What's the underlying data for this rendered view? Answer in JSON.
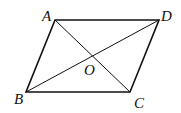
{
  "diagram": {
    "type": "parallelogram-with-diagonals",
    "stroke_color": "#111111",
    "background": "#ffffff",
    "vertices": {
      "A": {
        "x": 55,
        "y": 20,
        "label": "A",
        "label_x": 42,
        "label_y": 21
      },
      "D": {
        "x": 159,
        "y": 20,
        "label": "D",
        "label_x": 161,
        "label_y": 21
      },
      "B": {
        "x": 26,
        "y": 92,
        "label": "B",
        "label_x": 14,
        "label_y": 104
      },
      "C": {
        "x": 130,
        "y": 92,
        "label": "C",
        "label_x": 134,
        "label_y": 108
      }
    },
    "center": {
      "x": 92,
      "y": 56,
      "label": "O",
      "label_x": 84,
      "label_y": 75
    },
    "sides": [
      "AD",
      "DC",
      "CB",
      "BA"
    ],
    "diagonals": [
      "AC",
      "BD"
    ]
  }
}
